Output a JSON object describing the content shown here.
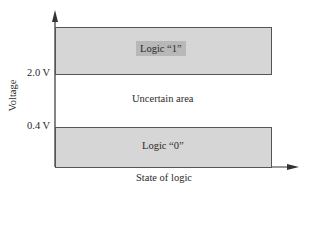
{
  "diagram": {
    "y_axis_label": "Voltage",
    "x_axis_label": "State of logic",
    "ticks": [
      {
        "label": "2.0 V",
        "value": 2.0
      },
      {
        "label": "0.4 V",
        "value": 0.4
      }
    ],
    "regions": [
      {
        "name": "logic-1",
        "label": "Logic “1”",
        "range": "above 2.0 V",
        "color": "#d6d6d6"
      },
      {
        "name": "uncertain",
        "label": "Uncertain area",
        "range": "0.4 V to 2.0 V",
        "color": "#ffffff"
      },
      {
        "name": "logic-0",
        "label": "Logic “0”",
        "range": "below 0.4 V",
        "color": "#d6d6d6"
      }
    ]
  }
}
